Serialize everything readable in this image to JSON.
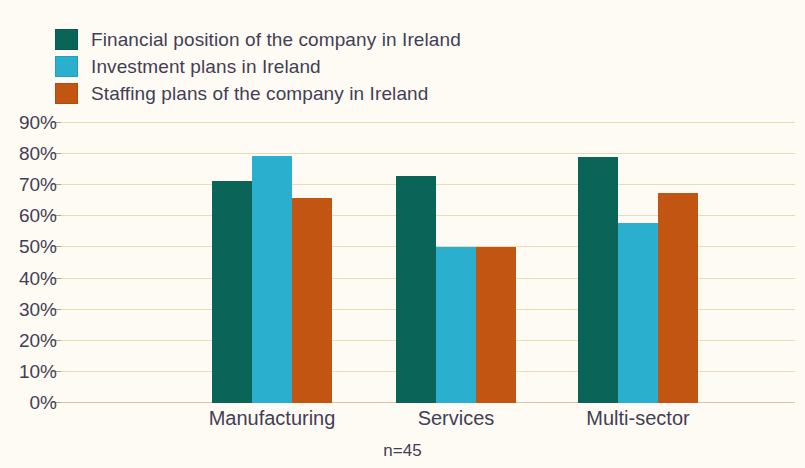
{
  "chart_data": {
    "type": "bar",
    "title": "",
    "xlabel": "",
    "ylabel": "",
    "ylim": [
      0,
      90
    ],
    "grid": true,
    "legend_position": "top-left",
    "footnote": "n=45",
    "categories": [
      "Manufacturing",
      "Services",
      "Multi-sector"
    ],
    "ytick_labels": [
      "90%",
      "80%",
      "70%",
      "60%",
      "50%",
      "40%",
      "30%",
      "20%",
      "10%",
      "0%"
    ],
    "ytick_values": [
      90,
      80,
      70,
      60,
      50,
      40,
      30,
      20,
      10,
      0
    ],
    "series": [
      {
        "name": "Financial position of the company in Ireland",
        "color": "#0a6457",
        "values": [
          71.5,
          73,
          79
        ]
      },
      {
        "name": "Investment plans in Ireland",
        "color": "#2bafcf",
        "values": [
          79.5,
          50,
          58
        ]
      },
      {
        "name": "Staffing plans of the company in Ireland",
        "color": "#c25511",
        "values": [
          66,
          50,
          67.5
        ]
      }
    ]
  },
  "colors": {
    "background": "#fdfbf4",
    "text": "#443e54",
    "gridline": "#e8dcb8",
    "axis": "#d8c9a0"
  }
}
